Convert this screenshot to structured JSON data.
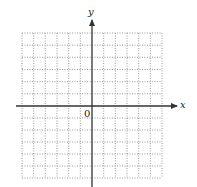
{
  "diagram": {
    "type": "coordinate-grid",
    "x_axis_label": "x",
    "y_axis_label": "y",
    "origin_label": "0",
    "grid": {
      "columns": 12,
      "rows": 12,
      "columns_left_of_origin": 6,
      "columns_right_of_origin": 6,
      "rows_above_origin": 6,
      "rows_below_origin": 6,
      "line_style": "dotted",
      "line_color": "#9a9a9a"
    },
    "axis_color": "#333333"
  }
}
